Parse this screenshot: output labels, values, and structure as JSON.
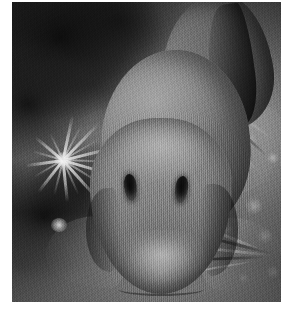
{
  "image": {
    "title": "Underwater photograph of a fish on the seabed",
    "subject": "fish",
    "description": "A grayscale underwater photograph showing a bottom-dwelling fish facing the camera head-on, resting on a gravel and algae seabed.",
    "color_mode": "grayscale",
    "orientation": "portrait",
    "frame": {
      "canvas_width": 293,
      "canvas_height": 314,
      "margin_color": "#ffffff",
      "photo_left": 12,
      "photo_top": 2,
      "photo_width": 269,
      "photo_height": 300
    },
    "palette": {
      "background_dark": "#2a2a2a",
      "background_mid": "#6e6e6e",
      "background_light": "#c8c8c8",
      "fish_body": "#828282",
      "fish_highlight": "#d7d7d7",
      "fish_shadow": "#3e3e3e",
      "eye_dark": "#0a0a0a",
      "anemone_light": "#f5f5f5"
    },
    "subjects": [
      {
        "name": "fish",
        "label": "Fish facing camera",
        "notes": "Broad rounded head with two dark vertical eye slits, tapering body extending toward the upper right, pectoral and pelvic fin rays splayed on the substrate."
      },
      {
        "name": "anemone",
        "label": "Sea anemone",
        "notes": "Pale radiating spiky tentacles on the left side of the frame."
      },
      {
        "name": "gravel",
        "label": "Gravel seabed",
        "notes": "Bright pebbles and coarse grains filling the right portion of the frame."
      },
      {
        "name": "algae",
        "label": "Dark algae mass",
        "notes": "Very dark mottled growth occupying the upper-left and lower-left corners."
      }
    ]
  }
}
